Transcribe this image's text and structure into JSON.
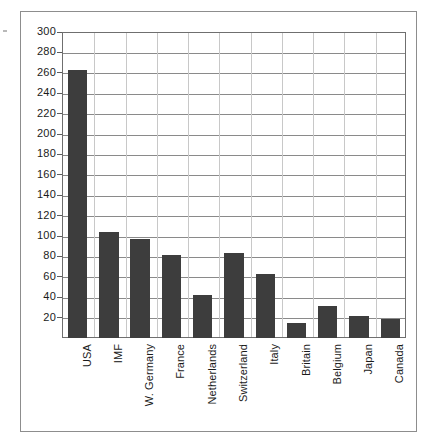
{
  "chart_data": {
    "type": "bar",
    "title": "",
    "subtitle": "",
    "xlabel": "",
    "ylabel": "",
    "categories": [
      "USA",
      "IMF",
      "W. Germany",
      "France",
      "Netherlands",
      "Switzerland",
      "Italy",
      "Britain",
      "Belgium",
      "Japan",
      "Canada"
    ],
    "values": [
      263,
      104,
      97,
      81,
      42,
      83,
      63,
      15,
      31,
      22,
      19
    ],
    "series": [
      {
        "name": "",
        "values": [
          263,
          104,
          97,
          81,
          42,
          83,
          63,
          15,
          31,
          22,
          19
        ]
      }
    ],
    "ylim": [
      0,
      300
    ],
    "xlim": null,
    "y_ticks": [
      20,
      40,
      60,
      80,
      100,
      120,
      140,
      160,
      180,
      200,
      220,
      240,
      260,
      280,
      300
    ],
    "y_tick_labels": [
      "20",
      "40",
      "60",
      "80",
      "100",
      "120",
      "140",
      "160",
      "180",
      "200",
      "220",
      "240",
      "260",
      "280",
      "300"
    ],
    "grid": true,
    "grid_axis": "y",
    "legend": false,
    "legend_position": "none",
    "annotations": [],
    "bar_color": "#3d3d3d",
    "gridline_color": "#8a8a8a",
    "axis_color": "#6f6f6f",
    "background_color": "#ffffff",
    "x_label_rotation": 90
  },
  "frame": {
    "border_color": "#8d8d8d"
  }
}
